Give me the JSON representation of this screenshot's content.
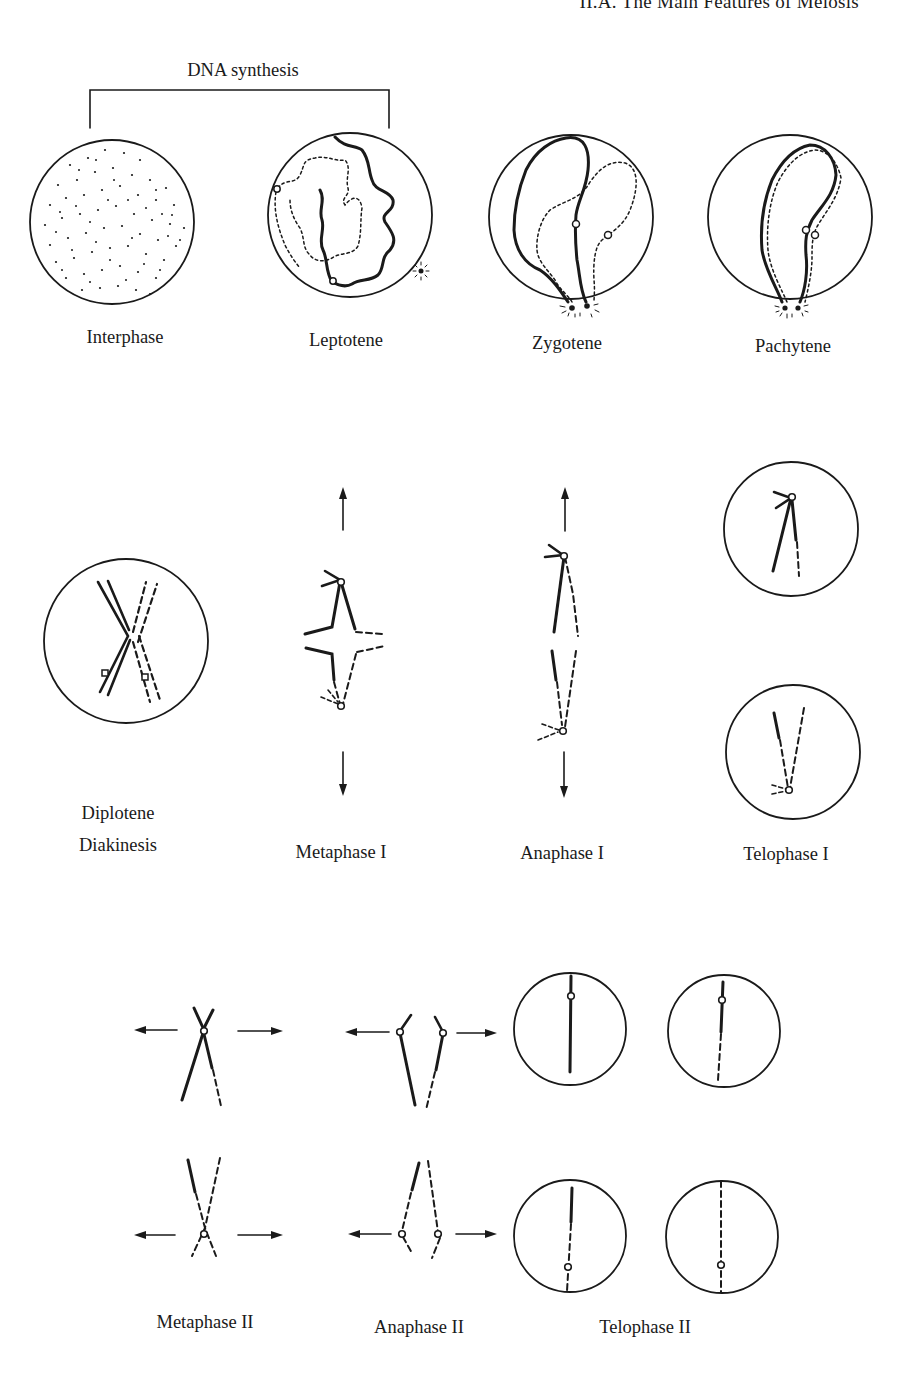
{
  "page": {
    "running_head": "II.A. The Main Features of Meiosis",
    "page_number": ""
  },
  "figure": {
    "bracket_label": "DNA synthesis",
    "stages": {
      "interphase": "Interphase",
      "leptotene": "Leptotene",
      "zygotene": "Zygotene",
      "pachytene": "Pachytene",
      "diplotene": "Diplotene",
      "diakinesis": "Diakinesis",
      "metaphase_1": "Metaphase I",
      "anaphase_1": "Anaphase I",
      "telophase_1": "Telophase I",
      "metaphase_2": "Metaphase II",
      "anaphase_2": "Anaphase II",
      "telophase_2": "Telophase II"
    },
    "legend": {
      "solid_line": "chromatid of one homolog",
      "dashed_line": "chromatid of other homolog",
      "open_circle": "centromere",
      "arrow": "direction of pole movement"
    },
    "colors": {
      "ink": "#1a1a1a",
      "paper": "#ffffff"
    }
  },
  "caption": {
    "text": ""
  }
}
